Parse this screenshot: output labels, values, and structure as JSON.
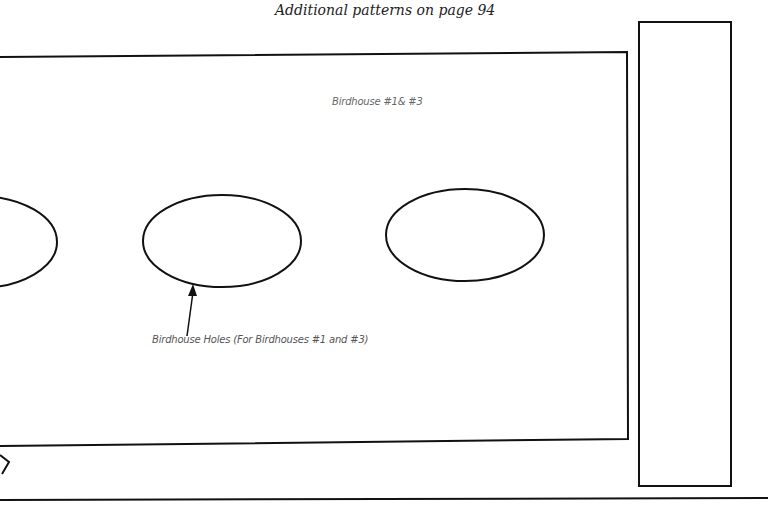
{
  "page": {
    "header_note": "Additional patterns on page 94",
    "pattern_title": "Birdhouse #1& #3",
    "holes_caption": "Birdhouse Holes (For Birdhouses #1 and #3)"
  },
  "shapes": {
    "main_panel": "rectangle",
    "side_panel": "rectangle",
    "holes": [
      "ellipse-partial-left",
      "ellipse-center",
      "ellipse-right"
    ],
    "arrow": "pointer-to-center-hole"
  },
  "colors": {
    "line": "#111111",
    "header_text": "#222222",
    "caption_text": "#555555",
    "background": "#ffffff"
  }
}
